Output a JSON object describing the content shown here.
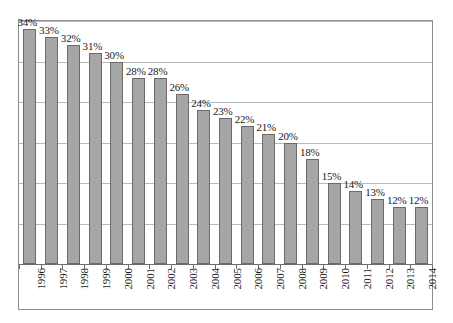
{
  "chart_data": {
    "type": "bar",
    "title": "",
    "subtitle": "",
    "xlabel": "",
    "ylabel": "",
    "categories": [
      "1996",
      "1997",
      "1998",
      "1999",
      "2000",
      "2001",
      "2002",
      "2003",
      "2004",
      "2005",
      "2006",
      "2007",
      "2008",
      "2009",
      "2010",
      "2011",
      "2012",
      "2013",
      "2014"
    ],
    "values": [
      34,
      33,
      32,
      31,
      30,
      28,
      28,
      26,
      24,
      23,
      22,
      21,
      20,
      18,
      15,
      14,
      13,
      12,
      12
    ],
    "value_labels": [
      "34%",
      "33%",
      "32%",
      "31%",
      "30%",
      "28%",
      "28%",
      "26%",
      "24%",
      "23%",
      "22%",
      "21%",
      "20%",
      "18%",
      "15%",
      "14%",
      "13%",
      "12%",
      "12%"
    ],
    "unit": "%",
    "ylim": [
      5,
      35
    ],
    "gridline_values": [
      35,
      30,
      25,
      20,
      15,
      10
    ],
    "grid": true,
    "legend": null,
    "legend_position": "none",
    "series": [
      {
        "name": "Percent",
        "values": [
          34,
          33,
          32,
          31,
          30,
          28,
          28,
          26,
          24,
          23,
          22,
          21,
          20,
          18,
          15,
          14,
          13,
          12,
          12
        ]
      }
    ],
    "colors": {
      "bar_fill": "#a6a6a6",
      "bar_border": "#6b6b6b",
      "gridline": "#b9b9b9",
      "frame": "#8d8d8d",
      "axis": "#6e6e6e",
      "text": "#1a1a1a",
      "background": "#ffffff"
    }
  }
}
